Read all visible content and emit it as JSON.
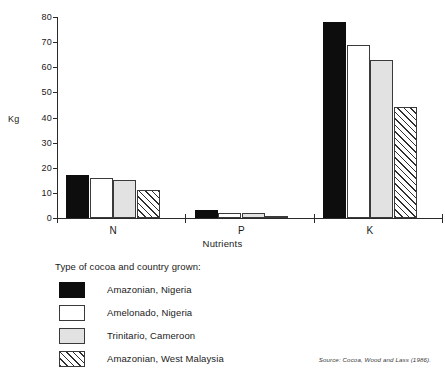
{
  "chart_data": {
    "type": "bar",
    "title": "",
    "xlabel": "Nutrients",
    "ylabel": "Kg",
    "categories": [
      "N",
      "P",
      "K"
    ],
    "ylim": [
      0,
      80
    ],
    "yticks": [
      0,
      10,
      20,
      30,
      40,
      50,
      60,
      70,
      80
    ],
    "ytick_labels": [
      "0",
      "10",
      "20",
      "30",
      "40",
      "50",
      "60",
      "70",
      "80"
    ],
    "grid": false,
    "legend_position": "below-left",
    "series": [
      {
        "name": "Amazonian, Nigeria",
        "swatch": "solid-black",
        "values": [
          17,
          3,
          78
        ]
      },
      {
        "name": "Amelonado, Nigeria",
        "swatch": "white-outline",
        "values": [
          16,
          2,
          69
        ]
      },
      {
        "name": "Trinitario, Cameroon",
        "swatch": "light-gray",
        "values": [
          15,
          2,
          63
        ]
      },
      {
        "name": "Amazonian, West Malaysia",
        "swatch": "diagonal-hatch",
        "values": [
          11,
          1,
          44
        ]
      }
    ]
  },
  "legend": {
    "title": "Type of cocoa and country grown:",
    "items": [
      {
        "label": "Amazonian, Nigeria"
      },
      {
        "label": "Amelonado, Nigeria"
      },
      {
        "label": "Trinitario, Cameroon"
      },
      {
        "label": "Amazonian, West Malaysia"
      }
    ]
  },
  "source": {
    "text": "Source: Cocoa, Wood and Lass (1986)."
  }
}
